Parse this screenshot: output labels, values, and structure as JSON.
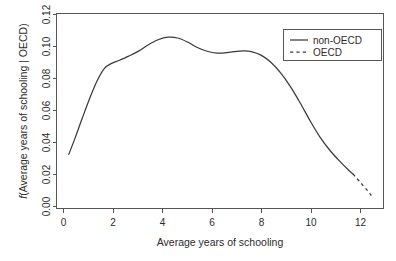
{
  "chart_data": {
    "type": "line",
    "title": "",
    "xlabel": "Average years of schooling",
    "ylabel": "f(Average years of schooling | OECD)",
    "ylabel_italic_prefix": "f",
    "ylabel_rest": "(Average years of schooling | OECD)",
    "xlim": [
      -0.35,
      13.0
    ],
    "ylim": [
      0.0,
      0.125
    ],
    "xticks": [
      0,
      2,
      4,
      6,
      8,
      10,
      12
    ],
    "xtick_labels": [
      "0",
      "2",
      "4",
      "6",
      "8",
      "10",
      "12"
    ],
    "yticks": [
      0.0,
      0.02,
      0.04,
      0.06,
      0.08,
      0.1,
      0.12
    ],
    "ytick_labels": [
      "0.00",
      "0.02",
      "0.04",
      "0.06",
      "0.08",
      "0.10",
      "0.12"
    ],
    "grid": false,
    "legend_position": "top-right",
    "legend_entries": [
      {
        "label": "non-OECD",
        "style": "solid"
      },
      {
        "label": "OECD",
        "style": "dashed"
      }
    ],
    "series": [
      {
        "name": "non-OECD",
        "style": "solid",
        "color": "#3a3a3a",
        "x": [
          0.15,
          0.4,
          0.7,
          1.0,
          1.3,
          1.6,
          1.9,
          2.2,
          2.6,
          3.0,
          3.4,
          3.8,
          4.2,
          4.6,
          5.0,
          5.4,
          5.8,
          6.2,
          6.6,
          7.0,
          7.3,
          7.6,
          8.0,
          8.4,
          8.8,
          9.2,
          9.6,
          10.0,
          10.4,
          10.8,
          11.2,
          11.6,
          11.75
        ],
        "y": [
          0.0347,
          0.0448,
          0.0578,
          0.0704,
          0.0816,
          0.0897,
          0.093,
          0.0949,
          0.0977,
          0.1009,
          0.105,
          0.1082,
          0.1098,
          0.1093,
          0.1067,
          0.1032,
          0.1008,
          0.0996,
          0.0999,
          0.1007,
          0.101,
          0.1006,
          0.0983,
          0.0937,
          0.0869,
          0.0781,
          0.0676,
          0.0563,
          0.0459,
          0.0375,
          0.0305,
          0.0242,
          0.0222
        ]
      },
      {
        "name": "OECD",
        "style": "dashed",
        "color": "#3a3a3a",
        "x": [
          11.75,
          11.95,
          12.15,
          12.35,
          12.5
        ],
        "y": [
          0.0222,
          0.0186,
          0.015,
          0.0115,
          0.0083
        ]
      }
    ]
  },
  "axis": {
    "x_title": "Average years of schooling",
    "y_title_italic": "f",
    "y_title_rest": "(Average years of schooling | OECD)"
  },
  "legend": {
    "items": [
      {
        "label": "non-OECD"
      },
      {
        "label": "OECD"
      }
    ]
  }
}
